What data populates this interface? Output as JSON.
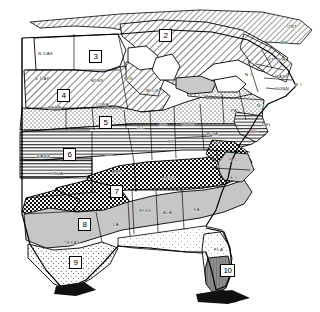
{
  "map": {
    "title": "United States Regional Zone Map",
    "style": "black-and-white line map with pattern fills",
    "colors": {
      "ink": "#000000",
      "paper": "#ffffff",
      "light_gray": "#cfcfcf",
      "mid_gray": "#9a9a9a"
    },
    "zones": [
      {
        "id": "zone-2",
        "number": "2",
        "x": 159,
        "y": 29,
        "pattern": "diagonal-hatch"
      },
      {
        "id": "zone-3",
        "number": "3",
        "x": 89,
        "y": 50,
        "pattern": "plain"
      },
      {
        "id": "zone-4",
        "number": "4",
        "x": 57,
        "y": 89,
        "pattern": "diagonal-hatch"
      },
      {
        "id": "zone-5",
        "number": "5",
        "x": 99,
        "y": 116,
        "pattern": "stipple"
      },
      {
        "id": "zone-6",
        "number": "6",
        "x": 63,
        "y": 148,
        "pattern": "horizontal-line"
      },
      {
        "id": "zone-7",
        "number": "7",
        "x": 110,
        "y": 185,
        "pattern": "crosshatch"
      },
      {
        "id": "zone-8",
        "number": "8",
        "x": 78,
        "y": 218,
        "pattern": "solid-gray"
      },
      {
        "id": "zone-9",
        "number": "9",
        "x": 69,
        "y": 256,
        "pattern": "fine-stipple"
      },
      {
        "id": "zone-10",
        "number": "10",
        "x": 222,
        "y": 264,
        "pattern": "dark-gray"
      }
    ],
    "state_labels": [
      {
        "name": "ONT",
        "x": 287,
        "y": 24
      },
      {
        "name": "N DAK",
        "x": 38,
        "y": 51
      },
      {
        "name": "S DAK",
        "x": 35,
        "y": 76
      },
      {
        "name": "MINN",
        "x": 91,
        "y": 78
      },
      {
        "name": "WIS",
        "x": 124,
        "y": 76
      },
      {
        "name": "NEBR",
        "x": 48,
        "y": 105
      },
      {
        "name": "IOWA",
        "x": 96,
        "y": 102
      },
      {
        "name": "MICH",
        "x": 146,
        "y": 88
      },
      {
        "name": "ME",
        "x": 281,
        "y": 40
      },
      {
        "name": "N H",
        "x": 277,
        "y": 57
      },
      {
        "name": "VT",
        "x": 268,
        "y": 57
      },
      {
        "name": "N Y",
        "x": 245,
        "y": 72
      },
      {
        "name": "MASS",
        "x": 275,
        "y": 74
      },
      {
        "name": "R I",
        "x": 295,
        "y": 82
      },
      {
        "name": "CONN",
        "x": 277,
        "y": 86
      },
      {
        "name": "PA",
        "x": 231,
        "y": 108
      },
      {
        "name": "N J",
        "x": 257,
        "y": 103
      },
      {
        "name": "DEL",
        "x": 262,
        "y": 122
      },
      {
        "name": "MD",
        "x": 250,
        "y": 129
      },
      {
        "name": "ILL",
        "x": 137,
        "y": 125
      },
      {
        "name": "IND",
        "x": 159,
        "y": 122
      },
      {
        "name": "OHIO",
        "x": 182,
        "y": 121
      },
      {
        "name": "W VA",
        "x": 206,
        "y": 131
      },
      {
        "name": "VA",
        "x": 215,
        "y": 140
      },
      {
        "name": "KY",
        "x": 168,
        "y": 139
      },
      {
        "name": "MO",
        "x": 105,
        "y": 152
      },
      {
        "name": "KANS",
        "x": 37,
        "y": 153
      },
      {
        "name": "OKLA",
        "x": 50,
        "y": 171
      },
      {
        "name": "ARK",
        "x": 112,
        "y": 169
      },
      {
        "name": "TENN",
        "x": 162,
        "y": 175
      },
      {
        "name": "N C",
        "x": 229,
        "y": 157
      },
      {
        "name": "S C",
        "x": 230,
        "y": 175
      },
      {
        "name": "MISS",
        "x": 139,
        "y": 208
      },
      {
        "name": "ALA",
        "x": 163,
        "y": 210
      },
      {
        "name": "GA",
        "x": 193,
        "y": 207
      },
      {
        "name": "LA",
        "x": 113,
        "y": 222
      },
      {
        "name": "TEXAS",
        "x": 64,
        "y": 240
      },
      {
        "name": "FLA",
        "x": 216,
        "y": 247
      }
    ]
  }
}
